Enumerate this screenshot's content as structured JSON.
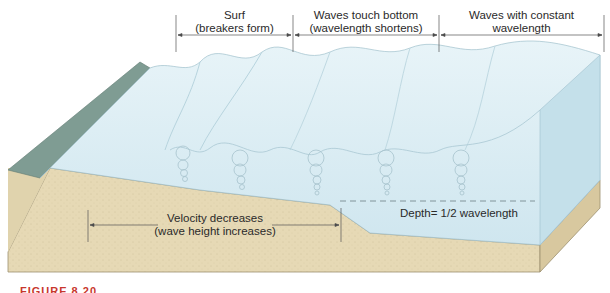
{
  "diagram": {
    "zones": [
      {
        "line1": "Surf",
        "line2": "(breakers form)"
      },
      {
        "line1": "Waves touch bottom",
        "line2": "(wavelength shortens)"
      },
      {
        "line1": "Waves with constant",
        "line2": "wavelength"
      }
    ],
    "bottom_label": {
      "line1": "Velocity decreases",
      "line2": "(wave height increases)"
    },
    "depth_label": "Depth= 1/2 wavelength",
    "figure_caption": "FIGURE 8.20",
    "colors": {
      "water": "#d7ebf2",
      "water_side": "#c4e0ea",
      "sand": "#e6d9b5",
      "sand_dark": "#d4c49a",
      "beach": "#7f9c93",
      "caption": "#c8372d"
    }
  }
}
